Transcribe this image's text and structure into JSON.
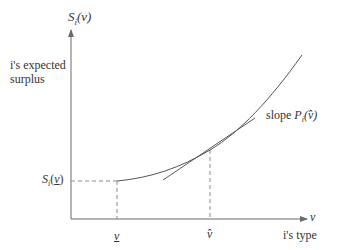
{
  "diagram": {
    "y_axis_label": "S_i(v)",
    "y_axis_label_main": "S",
    "y_axis_label_sub": "i",
    "y_axis_label_arg": "(v)",
    "y_axis_description_line1": "i's expected",
    "y_axis_description_line2": "surplus",
    "x_axis_label": "v",
    "x_axis_description": "i's type",
    "tick_v_lower": "v",
    "tick_v_hat": "v̂",
    "y_tick_main": "S",
    "y_tick_sub": "i",
    "y_tick_open": "(",
    "y_tick_arg": "v",
    "y_tick_close": ")",
    "slope_prefix": "slope ",
    "slope_main": "P",
    "slope_sub": "i",
    "slope_arg": "(v̂)",
    "colors": {
      "axis": "#6a6a6a",
      "curve": "#555555",
      "dashed": "#8a8a8a",
      "text": "#333333"
    }
  }
}
